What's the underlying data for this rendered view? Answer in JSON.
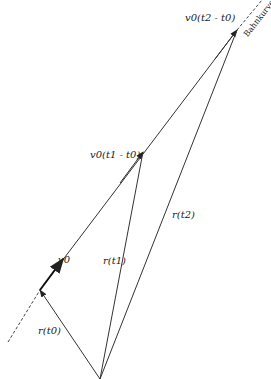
{
  "diagram": {
    "title": "",
    "curve_label": "Bahnkurve",
    "labels": {
      "v0": "v0",
      "v0_t1": "v0(t1 - t0)",
      "v0_t2": "v0(t2 - t0)",
      "r_t0": "r(t0)",
      "r_t1": "r(t1)",
      "r_t2": "r(t2)"
    },
    "points": {
      "origin": [
        100,
        379
      ],
      "r_t0": [
        40,
        290
      ],
      "r_t1": [
        143,
        152
      ],
      "r_t2": [
        237,
        30
      ]
    },
    "colors": {
      "line": "#333333",
      "background": "#ffffff"
    }
  }
}
